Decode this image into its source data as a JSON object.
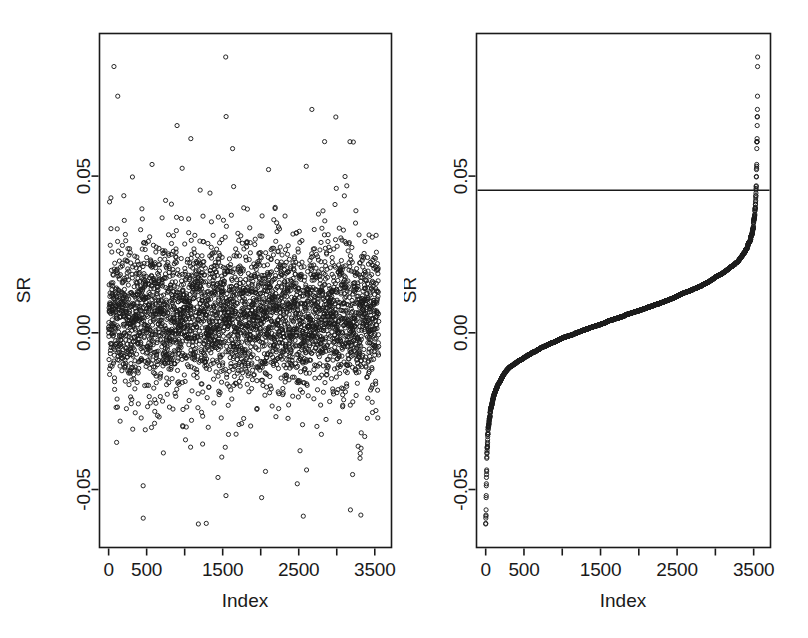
{
  "figure": {
    "type": "scatter-pair",
    "background": "#ffffff",
    "point_color": "#1c1c1c",
    "axis_color": "#1a1a1a",
    "width": 808,
    "height": 638
  },
  "chart_data": [
    {
      "type": "scatter",
      "title": "",
      "panel": "left",
      "xlabel": "Index",
      "ylabel": "SR",
      "xlim": [
        -120,
        3720
      ],
      "ylim": [
        -0.0685,
        0.0955
      ],
      "grid": false,
      "legend": null,
      "n_points": 3553,
      "marker": "open-circle",
      "marker_size_px": 4.2,
      "description": "Unsorted Sharpe-ratio-like statistic SR plotted against observation Index; dense cloud centred near 0.005 with spread roughly -0.03 to 0.035 and sparse outliers out to -0.061 and 0.088.",
      "xticks": [
        0,
        500,
        1000,
        1500,
        2000,
        2500,
        3000,
        3500
      ],
      "xtick_labels": [
        "0",
        "500",
        "",
        "1500",
        "",
        "2500",
        "",
        "3500"
      ],
      "yticks": [
        -0.05,
        0.0,
        0.05
      ],
      "ytick_labels": [
        "-0.05",
        "0.00",
        "0.05"
      ],
      "distribution": {
        "center": 0.0055,
        "scale": 0.0135,
        "min": -0.061,
        "max": 0.088
      }
    },
    {
      "type": "scatter",
      "title": "",
      "panel": "right",
      "xlabel": "Index",
      "ylabel": "SR",
      "xlim": [
        -120,
        3720
      ],
      "ylim": [
        -0.0685,
        0.0955
      ],
      "grid": false,
      "legend": null,
      "n_points": 3553,
      "marker": "open-circle",
      "marker_size_px": 4.2,
      "description": "Same SR values sorted in increasing order, producing a monotone S-shaped curve; a horizontal reference (threshold) line is drawn at SR = 0.0455.",
      "xticks": [
        0,
        500,
        1000,
        1500,
        2000,
        2500,
        3000,
        3500
      ],
      "xtick_labels": [
        "0",
        "500",
        "",
        "1500",
        "",
        "2500",
        "",
        "3500"
      ],
      "yticks": [
        -0.05,
        0.0,
        0.05
      ],
      "ytick_labels": [
        "-0.05",
        "0.00",
        "0.05"
      ],
      "reference_line": {
        "orientation": "horizontal",
        "value": 0.0455,
        "label": ""
      },
      "distribution": {
        "center": 0.0055,
        "scale": 0.0135,
        "min": -0.061,
        "max": 0.088
      }
    }
  ]
}
